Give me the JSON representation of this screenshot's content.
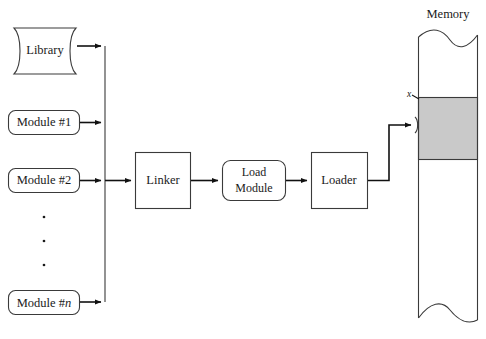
{
  "figure": {
    "memory_caption": "Memory",
    "address_marker": "x"
  },
  "nodes": {
    "library": {
      "label": "Library",
      "shape": "tape"
    },
    "module1": {
      "label": "Module #1",
      "shape": "rounded-rect"
    },
    "module2": {
      "label": "Module #2",
      "shape": "rounded-rect"
    },
    "module_n": {
      "label_prefix": "Module #",
      "label_suffix": "n",
      "shape": "rounded-rect"
    },
    "linker": {
      "label": "Linker",
      "shape": "rect"
    },
    "load_module": {
      "line1": "Load",
      "line2": "Module",
      "shape": "rounded-rect"
    },
    "loader": {
      "label": "Loader",
      "shape": "rect"
    }
  },
  "ellipsis": {
    "dot_count": 3
  },
  "colors": {
    "stroke": "#3a3a3a",
    "connector": "#111111",
    "allocated_region_fill": "#c9c9c9",
    "background": "#ffffff",
    "text": "#1a1a1a"
  },
  "memory": {
    "caption": "Memory",
    "allocated_block_label": "",
    "top_edge": "torn",
    "bottom_edge": "torn"
  }
}
